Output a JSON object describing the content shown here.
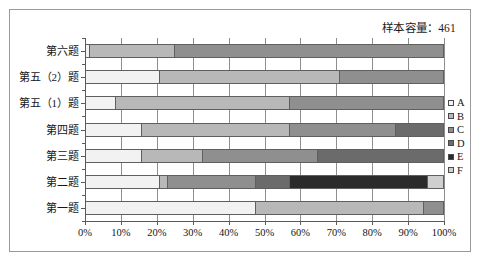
{
  "chart_data": {
    "type": "bar",
    "orientation": "horizontal",
    "stacked": true,
    "normalized_percent": true,
    "title": "样本容量：461",
    "sample_size": 461,
    "xlabel": "",
    "ylabel": "",
    "xlim": [
      0,
      100
    ],
    "grid": true,
    "legend_position": "right",
    "x_tick_labels": [
      "0%",
      "10%",
      "20%",
      "30%",
      "40%",
      "50%",
      "60%",
      "70%",
      "80%",
      "90%",
      "100%"
    ],
    "x_tick_values": [
      0,
      10,
      20,
      30,
      40,
      50,
      60,
      70,
      80,
      90,
      100
    ],
    "categories": [
      "第六题",
      "第五（2）题",
      "第五（1）题",
      "第四题",
      "第三题",
      "第二题",
      "第一题"
    ],
    "series": [
      {
        "name": "A",
        "color": "#f2f2f2",
        "values": [
          1.5,
          21.0,
          8.5,
          16.0,
          16.0,
          21.0,
          47.5
        ]
      },
      {
        "name": "B",
        "color": "#b8b8b8",
        "values": [
          23.5,
          50.0,
          48.5,
          41.0,
          17.0,
          2.0,
          47.0
        ]
      },
      {
        "name": "C",
        "color": "#8f8f8f",
        "values": [
          75.0,
          29.0,
          43.0,
          29.5,
          32.0,
          24.5,
          5.5
        ]
      },
      {
        "name": "D",
        "color": "#6b6b6b",
        "values": [
          0,
          0,
          0,
          13.5,
          35.0,
          9.5,
          0
        ]
      },
      {
        "name": "E",
        "color": "#2b2b2b",
        "values": [
          0,
          0,
          0,
          0,
          0,
          38.5,
          0
        ]
      },
      {
        "name": "F",
        "color": "#cfcfcf",
        "values": [
          0,
          0,
          0,
          0,
          0,
          4.5,
          0
        ]
      }
    ],
    "legend": [
      {
        "label": "A",
        "color": "#f2f2f2"
      },
      {
        "label": "B",
        "color": "#b8b8b8"
      },
      {
        "label": "C",
        "color": "#8f8f8f"
      },
      {
        "label": "D",
        "color": "#6b6b6b"
      },
      {
        "label": "E",
        "color": "#2b2b2b"
      },
      {
        "label": "F",
        "color": "#cfcfcf"
      }
    ]
  },
  "colors": {
    "frame_border": "#9a9a9a",
    "axis": "#5a5a5a",
    "gridline": "#8e8e8e",
    "segment_border": "#5f5f5f",
    "text": "#161616",
    "background": "#ffffff"
  }
}
